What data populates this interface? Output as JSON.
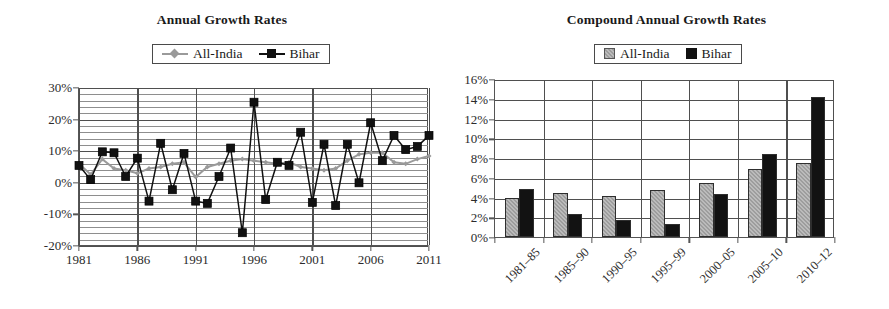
{
  "figure": {
    "panels": [
      "annual-growth-rates",
      "compound-annual-growth-rates"
    ]
  },
  "left": {
    "title": "Annual Growth Rates",
    "legend": [
      {
        "label": "All-India",
        "marker": "line-diamond-marker",
        "color": "#9a9a9a"
      },
      {
        "label": "Bihar",
        "marker": "line-square-marker",
        "color": "#111111"
      }
    ],
    "y_ticks": [
      "30%",
      "20%",
      "10%",
      "0%",
      "-10%",
      "-20%"
    ],
    "x_ticks": [
      "1981",
      "1986",
      "1991",
      "1996",
      "2001",
      "2006",
      "2011"
    ]
  },
  "right": {
    "title": "Compound Annual Growth Rates",
    "legend": [
      {
        "label": "All-India",
        "marker": "square-swatch",
        "color": "#9d9d9d"
      },
      {
        "label": "Bihar",
        "marker": "square-swatch",
        "color": "#121212"
      }
    ],
    "y_ticks": [
      "16%",
      "14%",
      "12%",
      "10%",
      "8%",
      "6%",
      "4%",
      "2%",
      "0%"
    ],
    "x_ticks": [
      "1981–85",
      "1985–90",
      "1990–95",
      "1995–99",
      "2000–05",
      "2005–10",
      "2010–12"
    ]
  },
  "chart_data": [
    {
      "type": "line",
      "title": "Annual Growth Rates",
      "xlabel": "",
      "ylabel": "",
      "ylim": [
        -20,
        30
      ],
      "xlim": [
        1981,
        2011
      ],
      "ytick_values": [
        30,
        20,
        10,
        0,
        -10,
        -20
      ],
      "ytick_labels": [
        "30%",
        "20%",
        "10%",
        "0%",
        "-10%",
        "-20%"
      ],
      "xtick_values": [
        1981,
        1986,
        1991,
        1996,
        2001,
        2006,
        2011
      ],
      "xtick_labels": [
        "1981",
        "1986",
        "1991",
        "1996",
        "2001",
        "2006",
        "2011"
      ],
      "grid": "horizontal-minor-2pct-major-10pct-plus-vertical-at-xticks",
      "legend_position": "above-axes-center",
      "x": [
        1981,
        1982,
        1983,
        1984,
        1985,
        1986,
        1987,
        1988,
        1989,
        1990,
        1991,
        1992,
        1993,
        1994,
        1995,
        1996,
        1997,
        1998,
        1999,
        2000,
        2001,
        2002,
        2003,
        2004,
        2005,
        2006,
        2007,
        2008,
        2009,
        2010,
        2011
      ],
      "series": [
        {
          "name": "All-India",
          "color": "#9a9a9a",
          "marker": "diamond",
          "values": [
            6.0,
            2.6,
            7.5,
            4.5,
            4.0,
            3.0,
            4.5,
            5.0,
            6.0,
            6.5,
            1.8,
            5.0,
            6.0,
            7.0,
            7.5,
            7.0,
            6.5,
            6.0,
            6.5,
            5.0,
            4.5,
            4.0,
            4.5,
            7.0,
            9.0,
            9.5,
            9.5,
            6.5,
            6.0,
            7.5,
            8.5
          ]
        },
        {
          "name": "Bihar",
          "color": "#111111",
          "marker": "square",
          "values": [
            5.5,
            1.0,
            9.8,
            9.5,
            2.0,
            7.8,
            -5.8,
            12.5,
            -2.2,
            9.3,
            -5.8,
            -6.5,
            2.0,
            11.0,
            -15.8,
            25.5,
            -5.3,
            6.5,
            5.5,
            16.0,
            -6.2,
            12.2,
            -7.2,
            12.2,
            0.0,
            19.0,
            7.0,
            15.0,
            10.5,
            11.5,
            15.0
          ]
        }
      ]
    },
    {
      "type": "bar",
      "title": "Compound Annual Growth Rates",
      "xlabel": "",
      "ylabel": "",
      "ylim": [
        0,
        16
      ],
      "ytick_values": [
        0,
        2,
        4,
        6,
        8,
        10,
        12,
        14,
        16
      ],
      "ytick_labels": [
        "0%",
        "2%",
        "4%",
        "6%",
        "8%",
        "10%",
        "12%",
        "14%",
        "16%"
      ],
      "grid": "horizontal-2pct-plus-vertical-group-separators",
      "legend_position": "above-axes-center",
      "categories": [
        "1981–85",
        "1985–90",
        "1990–95",
        "1995–99",
        "2000–05",
        "2005–10",
        "2010–12"
      ],
      "series": [
        {
          "name": "All-India",
          "color": "#9d9d9d",
          "values": [
            4.0,
            4.5,
            4.2,
            4.8,
            5.5,
            6.9,
            7.5
          ]
        },
        {
          "name": "Bihar",
          "color": "#121212",
          "values": [
            4.9,
            2.3,
            1.7,
            1.3,
            4.4,
            8.4,
            14.2
          ]
        }
      ]
    }
  ]
}
